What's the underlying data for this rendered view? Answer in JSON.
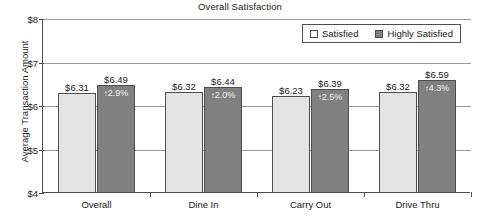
{
  "chart_data": {
    "type": "bar",
    "title": "Overall Satisfaction",
    "xlabel": "",
    "ylabel": "Average Transaction Amount",
    "ylim": [
      4,
      8
    ],
    "yticks": [
      "$4",
      "$5",
      "$6",
      "$7",
      "$8"
    ],
    "ytick_values": [
      4,
      5,
      6,
      7,
      8
    ],
    "grid": true,
    "legend_position": "top-right",
    "categories": [
      "Overall",
      "Dine In",
      "Carry Out",
      "Drive Thru"
    ],
    "series": [
      {
        "name": "Satisfied",
        "color": "#e3e3e3",
        "values": [
          6.31,
          6.32,
          6.23,
          6.32
        ],
        "labels": [
          "$6.31",
          "$6.32",
          "$6.23",
          "$6.32"
        ]
      },
      {
        "name": "Highly Satisfied",
        "color": "#808080",
        "values": [
          6.49,
          6.44,
          6.39,
          6.59
        ],
        "labels": [
          "$6.49",
          "$6.44",
          "$6.39",
          "$6.59"
        ],
        "inbar_labels": [
          "2.9%",
          "2.0%",
          "2.5%",
          "4.3%"
        ],
        "inbar_arrow": "↑"
      }
    ]
  },
  "legend": {
    "items": [
      {
        "label": "Satisfied",
        "swatch": "light"
      },
      {
        "label": "Highly Satisfied",
        "swatch": "dark"
      }
    ]
  },
  "colors": {
    "satisfied": "#e3e3e3",
    "highly_satisfied": "#808080",
    "axis": "#4d4d4d",
    "grid": "#9a9a9a",
    "text": "#1a1a1a"
  }
}
